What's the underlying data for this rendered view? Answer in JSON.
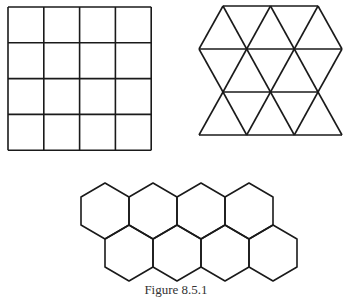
{
  "figure": {
    "caption": "Figure 8.5.1",
    "stroke_color": "#1a1a1a",
    "background": "#ffffff",
    "panels": [
      {
        "name": "square-tiling",
        "shape": "square",
        "rows": 4,
        "cols": 4
      },
      {
        "name": "triangle-tiling",
        "shape": "equilateral-triangle",
        "rows": 3
      },
      {
        "name": "hexagon-tiling",
        "shape": "regular-hexagon",
        "rows": 2,
        "per_row": 4
      }
    ]
  }
}
